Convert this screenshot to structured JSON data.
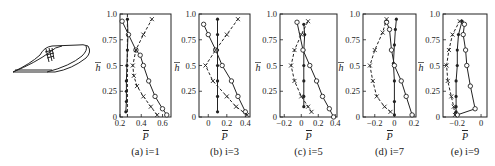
{
  "figure": {
    "illustration": "turbine-blade-icon",
    "ylabel": "h̄",
    "xlabel": "P̄",
    "panels": [
      {
        "caption": "(a) i=1"
      },
      {
        "caption": "(b) i=3"
      },
      {
        "caption": "(c) i=5"
      },
      {
        "caption": "(d) i=7"
      },
      {
        "caption": "(e) i=9"
      }
    ]
  },
  "chart_data": [
    {
      "type": "line",
      "title": "(a) i=1",
      "xlabel": "P̄",
      "ylabel": "h̄",
      "xlim": [
        0.2,
        0.68
      ],
      "ylim": [
        0,
        1.0
      ],
      "xticks": [
        0.2,
        0.4,
        0.6
      ],
      "xtick_labels": [
        "0.2",
        "0.4",
        "0.6"
      ],
      "yticks": [
        0,
        0.25,
        0.5,
        0.75,
        1.0
      ],
      "ytick_labels": [
        "0",
        "0.25",
        "0.5",
        "0.75",
        "1.0"
      ],
      "grid": false,
      "series": [
        {
          "name": "dots",
          "marker": "dot",
          "style": "solid",
          "points": [
            [
              0.255,
              0.05
            ],
            [
              0.26,
              0.15
            ],
            [
              0.26,
              0.25
            ],
            [
              0.26,
              0.35
            ],
            [
              0.265,
              0.5
            ],
            [
              0.27,
              0.65
            ],
            [
              0.275,
              0.8
            ],
            [
              0.27,
              0.95
            ]
          ]
        },
        {
          "name": "circles",
          "marker": "circle",
          "style": "solid",
          "points": [
            [
              0.22,
              0.93
            ],
            [
              0.28,
              0.8
            ],
            [
              0.35,
              0.65
            ],
            [
              0.39,
              0.6
            ],
            [
              0.42,
              0.5
            ],
            [
              0.47,
              0.35
            ],
            [
              0.53,
              0.2
            ],
            [
              0.6,
              0.08
            ],
            [
              0.64,
              0.02
            ]
          ]
        },
        {
          "name": "crosses",
          "marker": "cross",
          "style": "dashed",
          "points": [
            [
              0.55,
              0.02
            ],
            [
              0.49,
              0.1
            ],
            [
              0.42,
              0.2
            ],
            [
              0.36,
              0.3
            ],
            [
              0.33,
              0.4
            ],
            [
              0.32,
              0.5
            ],
            [
              0.35,
              0.65
            ],
            [
              0.42,
              0.8
            ],
            [
              0.5,
              0.95
            ]
          ]
        },
        {
          "name": "reference",
          "marker": "none",
          "style": "dashed",
          "points": [
            [
              0.27,
              0
            ],
            [
              0.27,
              1.0
            ]
          ]
        }
      ]
    },
    {
      "type": "line",
      "title": "(b) i=3",
      "xlabel": "P̄",
      "ylabel": "h̄",
      "xlim": [
        -0.1,
        0.45
      ],
      "ylim": [
        0,
        1.0
      ],
      "xticks": [
        0,
        0.2,
        0.4
      ],
      "xtick_labels": [
        "0",
        "0.2",
        "0.4"
      ],
      "yticks": [
        0,
        0.25,
        0.5,
        0.75,
        1.0
      ],
      "ytick_labels": [
        "0",
        "0.25",
        "0.5",
        "0.75",
        "1.0"
      ],
      "grid": false,
      "series": [
        {
          "name": "dots",
          "marker": "dot",
          "style": "solid",
          "points": [
            [
              0.1,
              0.05
            ],
            [
              0.1,
              0.2
            ],
            [
              0.1,
              0.35
            ],
            [
              0.1,
              0.5
            ],
            [
              0.1,
              0.65
            ],
            [
              0.1,
              0.8
            ],
            [
              0.1,
              0.95
            ]
          ]
        },
        {
          "name": "circles",
          "marker": "circle",
          "style": "solid",
          "points": [
            [
              -0.05,
              0.9
            ],
            [
              0.0,
              0.8
            ],
            [
              0.08,
              0.65
            ],
            [
              0.15,
              0.5
            ],
            [
              0.25,
              0.35
            ],
            [
              0.32,
              0.2
            ],
            [
              0.4,
              0.05
            ]
          ]
        },
        {
          "name": "crosses",
          "marker": "cross",
          "style": "dashed",
          "points": [
            [
              0.42,
              0.02
            ],
            [
              0.3,
              0.1
            ],
            [
              0.2,
              0.2
            ],
            [
              0.05,
              0.35
            ],
            [
              -0.03,
              0.5
            ],
            [
              0.08,
              0.65
            ],
            [
              0.2,
              0.8
            ],
            [
              0.32,
              0.95
            ]
          ]
        }
      ]
    },
    {
      "type": "line",
      "title": "(c) i=5",
      "xlabel": "P̄",
      "ylabel": "h̄",
      "xlim": [
        -0.25,
        0.42
      ],
      "ylim": [
        0,
        1.0
      ],
      "xticks": [
        -0.2,
        0,
        0.2,
        0.4
      ],
      "xtick_labels": [
        "-0.2",
        "0",
        "0.2",
        "0.4"
      ],
      "yticks": [
        0,
        0.25,
        0.5,
        0.75,
        1.0
      ],
      "ytick_labels": [
        "0",
        "0.25",
        "0.5",
        "0.75",
        "1.0"
      ],
      "grid": false,
      "series": [
        {
          "name": "dots",
          "marker": "dot",
          "style": "solid",
          "points": [
            [
              0.03,
              0.1
            ],
            [
              0.03,
              0.2
            ],
            [
              0.03,
              0.35
            ],
            [
              0.03,
              0.5
            ],
            [
              0.03,
              0.65
            ],
            [
              0.04,
              0.8
            ],
            [
              0.03,
              0.9
            ]
          ]
        },
        {
          "name": "circles",
          "marker": "circle",
          "style": "solid",
          "points": [
            [
              -0.05,
              0.92
            ],
            [
              0.02,
              0.65
            ],
            [
              0.1,
              0.5
            ],
            [
              0.18,
              0.35
            ],
            [
              0.25,
              0.2
            ],
            [
              0.33,
              0.08
            ],
            [
              0.38,
              0.0
            ]
          ]
        },
        {
          "name": "crosses",
          "marker": "cross",
          "style": "dashed",
          "points": [
            [
              0.12,
              0.05
            ],
            [
              0.08,
              0.1
            ],
            [
              0.0,
              0.2
            ],
            [
              -0.08,
              0.35
            ],
            [
              -0.12,
              0.5
            ],
            [
              -0.08,
              0.65
            ],
            [
              0.0,
              0.8
            ],
            [
              0.08,
              0.93
            ]
          ]
        }
      ]
    },
    {
      "type": "line",
      "title": "(d) i=7",
      "xlabel": "P̄",
      "ylabel": "h̄",
      "xlim": [
        -0.32,
        0.22
      ],
      "ylim": [
        0,
        1.0
      ],
      "xticks": [
        -0.2,
        0,
        0.2
      ],
      "xtick_labels": [
        "-0.2",
        "0",
        "0.2"
      ],
      "yticks": [
        0,
        0.25,
        0.5,
        0.75,
        1.0
      ],
      "ytick_labels": [
        "0",
        "0.25",
        "0.5",
        "0.75",
        "1.0"
      ],
      "grid": false,
      "series": [
        {
          "name": "dots",
          "marker": "dot",
          "style": "solid",
          "points": [
            [
              0.0,
              0.02
            ],
            [
              0.0,
              0.15
            ],
            [
              0.0,
              0.35
            ],
            [
              -0.01,
              0.52
            ],
            [
              0.0,
              0.7
            ],
            [
              0.01,
              0.85
            ],
            [
              0.02,
              0.95
            ]
          ]
        },
        {
          "name": "circles",
          "marker": "circle",
          "style": "solid",
          "points": [
            [
              -0.08,
              0.92
            ],
            [
              -0.05,
              0.85
            ],
            [
              -0.03,
              0.65
            ],
            [
              0.0,
              0.5
            ],
            [
              0.07,
              0.35
            ],
            [
              0.12,
              0.2
            ],
            [
              0.18,
              0.02
            ]
          ]
        },
        {
          "name": "crosses",
          "marker": "cross",
          "style": "dashed",
          "points": [
            [
              -0.04,
              0.05
            ],
            [
              -0.1,
              0.1
            ],
            [
              -0.18,
              0.2
            ],
            [
              -0.22,
              0.35
            ],
            [
              -0.25,
              0.5
            ],
            [
              -0.2,
              0.65
            ],
            [
              -0.12,
              0.82
            ],
            [
              -0.08,
              0.95
            ]
          ]
        }
      ]
    },
    {
      "type": "line",
      "title": "(e) i=9",
      "xlabel": "P̄",
      "ylabel": "h̄",
      "xlim": [
        -0.32,
        0.05
      ],
      "ylim": [
        0,
        1.0
      ],
      "xticks": [
        -0.2,
        0
      ],
      "xtick_labels": [
        "-0.2",
        "0"
      ],
      "yticks": [
        0,
        0.25,
        0.5,
        0.75,
        1.0
      ],
      "ytick_labels": [
        "0",
        "0.25",
        "0.5",
        "0.75",
        "1.0"
      ],
      "grid": false,
      "series": [
        {
          "name": "dots",
          "marker": "dot",
          "style": "solid",
          "points": [
            [
              -0.21,
              0.05
            ],
            [
              -0.21,
              0.1
            ],
            [
              -0.21,
              0.2
            ],
            [
              -0.21,
              0.35
            ],
            [
              -0.2,
              0.5
            ],
            [
              -0.2,
              0.65
            ],
            [
              -0.19,
              0.8
            ],
            [
              -0.16,
              0.93
            ]
          ]
        },
        {
          "name": "circles",
          "marker": "circle",
          "style": "solid",
          "points": [
            [
              -0.2,
              0.02
            ],
            [
              -0.05,
              0.08
            ],
            [
              -0.09,
              0.3
            ],
            [
              -0.12,
              0.5
            ],
            [
              -0.13,
              0.65
            ],
            [
              -0.15,
              0.8
            ],
            [
              -0.14,
              0.9
            ]
          ]
        },
        {
          "name": "crosses",
          "marker": "cross",
          "style": "dashed",
          "points": [
            [
              -0.22,
              0.02
            ],
            [
              -0.23,
              0.1
            ],
            [
              -0.25,
              0.2
            ],
            [
              -0.28,
              0.35
            ],
            [
              -0.29,
              0.5
            ],
            [
              -0.27,
              0.65
            ],
            [
              -0.24,
              0.8
            ],
            [
              -0.18,
              0.93
            ]
          ]
        }
      ]
    }
  ]
}
